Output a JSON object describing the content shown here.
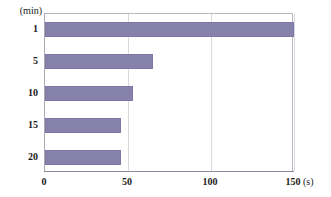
{
  "chart_data": {
    "type": "bar",
    "orientation": "horizontal",
    "title": "",
    "xlabel": "(s)",
    "ylabel": "(min)",
    "categories": [
      "1",
      "5",
      "10",
      "15",
      "20"
    ],
    "values": [
      150,
      65,
      53,
      46,
      46
    ],
    "xlim": [
      0,
      150
    ],
    "xticks": [
      0,
      50,
      100,
      150
    ],
    "xtick_labels": [
      "0",
      "50",
      "100",
      "150"
    ],
    "grid": true,
    "grid_axis": "x",
    "legend": null,
    "series": [
      {
        "name": "",
        "values": [
          150,
          65,
          53,
          46,
          46
        ]
      }
    ],
    "bar_color": "#8682AC",
    "bar_border_color": "#7D79A6",
    "gridline_color": "#D8D8E0",
    "frame_color": "#B9B9C4",
    "axis_color": "#8A8A98",
    "background": "#FFFFFF"
  },
  "axes": {
    "y_unit": "(min)",
    "x_unit": "(s)"
  }
}
